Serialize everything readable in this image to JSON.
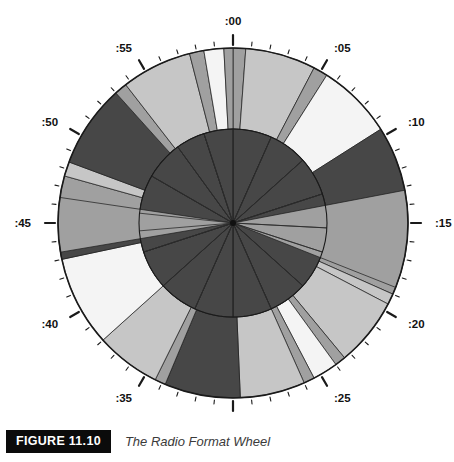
{
  "figure": {
    "badge": "FIGURE 11.10",
    "caption": "The Radio Format Wheel"
  },
  "wheel": {
    "title": "The Radio Format Wheel",
    "center_x": 233,
    "center_y": 223,
    "outer_radius": 175,
    "inner_radius": 94,
    "minute_labels": [
      ":00",
      ":05",
      ":10",
      ":15",
      ":20",
      ":25",
      ":30",
      ":35",
      ":40",
      ":45",
      ":50",
      ":55"
    ],
    "minutes_total": 60,
    "colors": {
      "dark": "#474747",
      "medium": "#a0a0a0",
      "light": "#c6c6c6",
      "white": "#f4f4f4",
      "outline": "#1a1a1a",
      "tick": "#1a1a1a",
      "label": "#111111",
      "badge_bg": "#0b0b0b",
      "badge_text": "#ffffff",
      "caption_text": "#3a3a3a"
    }
  },
  "chart_data": {
    "type": "pie",
    "title": "The Radio Format Wheel",
    "xlabel": "",
    "ylabel": "",
    "units": "minutes",
    "total": 60,
    "legend_position": "none",
    "grid": false,
    "axis_ticks_minutes": [
      0,
      1,
      2,
      3,
      4,
      5,
      6,
      7,
      8,
      9,
      10,
      11,
      12,
      13,
      14,
      15,
      16,
      17,
      18,
      19,
      20,
      21,
      22,
      23,
      24,
      25,
      26,
      27,
      28,
      29,
      30,
      31,
      32,
      33,
      34,
      35,
      36,
      37,
      38,
      39,
      40,
      41,
      42,
      43,
      44,
      45,
      46,
      47,
      48,
      49,
      50,
      51,
      52,
      53,
      54,
      55,
      56,
      57,
      58,
      59
    ],
    "major_tick_minutes": [
      0,
      5,
      10,
      15,
      20,
      25,
      30,
      35,
      40,
      45,
      50,
      55
    ],
    "rings": [
      {
        "name": "outer-ring",
        "inner_radius": 94,
        "outer_radius": 175,
        "segments": [
          {
            "start": 0.0,
            "end": 0.7,
            "color": "medium"
          },
          {
            "start": 0.7,
            "end": 4.6,
            "color": "light"
          },
          {
            "start": 4.6,
            "end": 5.4,
            "color": "medium"
          },
          {
            "start": 5.4,
            "end": 9.6,
            "color": "white"
          },
          {
            "start": 9.6,
            "end": 14.0,
            "color": "dark"
          },
          {
            "start": 14.0,
            "end": 14.7,
            "color": "medium"
          },
          {
            "start": 14.7,
            "end": 19.0,
            "color": "medium"
          },
          {
            "start": 19.0,
            "end": 19.6,
            "color": "light"
          },
          {
            "start": 19.6,
            "end": 23.4,
            "color": "light"
          },
          {
            "start": 23.4,
            "end": 24.0,
            "color": "medium"
          },
          {
            "start": 24.0,
            "end": 25.4,
            "color": "white"
          },
          {
            "start": 25.4,
            "end": 26.0,
            "color": "medium"
          },
          {
            "start": 26.0,
            "end": 29.6,
            "color": "light"
          },
          {
            "start": 29.6,
            "end": 33.8,
            "color": "dark"
          },
          {
            "start": 33.8,
            "end": 34.4,
            "color": "medium"
          },
          {
            "start": 34.4,
            "end": 38.0,
            "color": "light"
          },
          {
            "start": 38.0,
            "end": 43.0,
            "color": "white"
          },
          {
            "start": 43.0,
            "end": 43.6,
            "color": "dark"
          },
          {
            "start": 43.6,
            "end": 45.0,
            "color": "medium"
          },
          {
            "start": 45.0,
            "end": 47.6,
            "color": "medium"
          },
          {
            "start": 47.6,
            "end": 48.4,
            "color": "light"
          },
          {
            "start": 48.4,
            "end": 53.0,
            "color": "dark"
          },
          {
            "start": 53.0,
            "end": 53.7,
            "color": "medium"
          },
          {
            "start": 53.7,
            "end": 57.6,
            "color": "light"
          },
          {
            "start": 57.6,
            "end": 58.4,
            "color": "medium"
          },
          {
            "start": 58.4,
            "end": 59.5,
            "color": "white"
          },
          {
            "start": 59.5,
            "end": 60.0,
            "color": "medium"
          }
        ]
      },
      {
        "name": "inner-disc",
        "inner_radius": 0,
        "outer_radius": 94,
        "segments": [
          {
            "start": 0.0,
            "end": 4.0,
            "color": "dark"
          },
          {
            "start": 4.0,
            "end": 8.0,
            "color": "dark"
          },
          {
            "start": 8.0,
            "end": 12.0,
            "color": "dark"
          },
          {
            "start": 12.0,
            "end": 15.5,
            "color": "dark"
          },
          {
            "start": 15.5,
            "end": 18.0,
            "color": "dark"
          },
          {
            "start": 18.0,
            "end": 22.0,
            "color": "dark"
          },
          {
            "start": 22.0,
            "end": 26.0,
            "color": "dark"
          },
          {
            "start": 26.0,
            "end": 30.0,
            "color": "dark"
          },
          {
            "start": 30.0,
            "end": 34.0,
            "color": "dark"
          },
          {
            "start": 34.0,
            "end": 38.0,
            "color": "dark"
          },
          {
            "start": 38.0,
            "end": 42.0,
            "color": "dark"
          },
          {
            "start": 42.0,
            "end": 44.2,
            "color": "dark"
          },
          {
            "start": 46.0,
            "end": 50.0,
            "color": "dark"
          },
          {
            "start": 50.0,
            "end": 54.0,
            "color": "dark"
          },
          {
            "start": 54.0,
            "end": 57.0,
            "color": "dark"
          },
          {
            "start": 57.0,
            "end": 60.0,
            "color": "dark"
          }
        ]
      },
      {
        "name": "full-radius-wedges",
        "inner_radius": 0,
        "outer_radius": 175,
        "segments": [
          {
            "start": 13.2,
            "end": 18.6,
            "color": "medium"
          },
          {
            "start": 43.4,
            "end": 46.4,
            "color": "medium"
          }
        ]
      }
    ]
  }
}
